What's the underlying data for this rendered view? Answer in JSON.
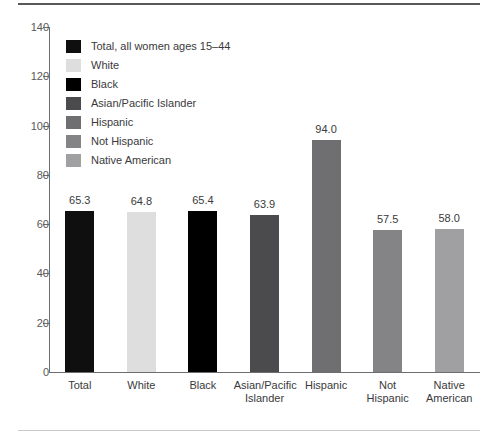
{
  "chart_data": {
    "type": "bar",
    "title": "",
    "xlabel": "",
    "ylabel": "",
    "ylim": [
      0,
      140
    ],
    "ytick_step": 20,
    "yticks": [
      "0",
      "20",
      "40",
      "60",
      "80",
      "100",
      "120",
      "140"
    ],
    "grid": false,
    "legend_position": "upper-left-inside",
    "categories": [
      "Total",
      "White",
      "Black",
      "Asian/Pacific Islander",
      "Hispanic",
      "Not Hispanic",
      "Native American"
    ],
    "category_labels": [
      [
        "Total"
      ],
      [
        "White"
      ],
      [
        "Black"
      ],
      [
        "Asian/Pacific",
        "Islander"
      ],
      [
        "Hispanic"
      ],
      [
        "Not Hispanic"
      ],
      [
        "Native",
        "American"
      ]
    ],
    "values": [
      65.3,
      64.8,
      65.4,
      63.9,
      94.0,
      57.5,
      58.0
    ],
    "value_labels": [
      "65.3",
      "64.8",
      "65.4",
      "63.9",
      "94.0",
      "57.5",
      "58.0"
    ],
    "colors": [
      "#100f10",
      "#dedede",
      "#000000",
      "#4b4b4d",
      "#6f6f71",
      "#848486",
      "#a0a0a2"
    ],
    "legend": [
      {
        "label": "Total, all women ages 15–44",
        "color": "#100f10"
      },
      {
        "label": "White",
        "color": "#dedede"
      },
      {
        "label": "Black",
        "color": "#000000"
      },
      {
        "label": "Asian/Pacific Islander",
        "color": "#4b4b4d"
      },
      {
        "label": "Hispanic",
        "color": "#6f6f71"
      },
      {
        "label": "Not Hispanic",
        "color": "#848486"
      },
      {
        "label": "Native American",
        "color": "#a0a0a2"
      }
    ]
  },
  "style": {
    "background": "#ffffff",
    "axis_color": "#6e6e70",
    "text_color": "#3a3a3c",
    "rule_top_color": "#58585a",
    "rule_bottom_color": "#c9c9cb"
  }
}
